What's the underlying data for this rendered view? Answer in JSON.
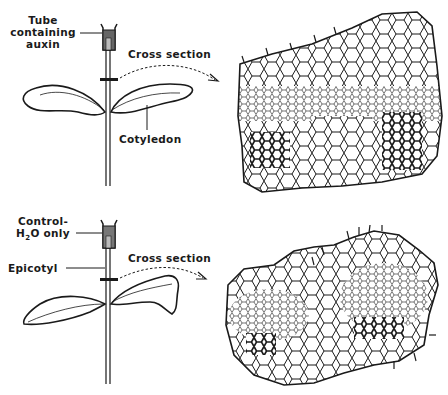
{
  "figure": {
    "top_panel": {
      "name": "auxin-treatment",
      "labels": {
        "tube_line1": "Tube",
        "tube_line2": "containing",
        "tube_line3": "auxin",
        "cross_section": "Cross section",
        "cotyledon": "Cotyledon"
      },
      "section_description": "Stem cross section with proliferated tissue after auxin treatment"
    },
    "bottom_panel": {
      "name": "control",
      "labels": {
        "control_line1": "Control-",
        "control_line2_prefix": "H",
        "control_line2_sub": "2",
        "control_line2_suffix": "O only",
        "epicotyl": "Epicotyl",
        "cross_section": "Cross section"
      },
      "section_description": "Normal stem cross section of control seedling"
    },
    "colors": {
      "ink": "#1a1a1a",
      "tube_fill": "#555555",
      "background": "#ffffff"
    }
  }
}
